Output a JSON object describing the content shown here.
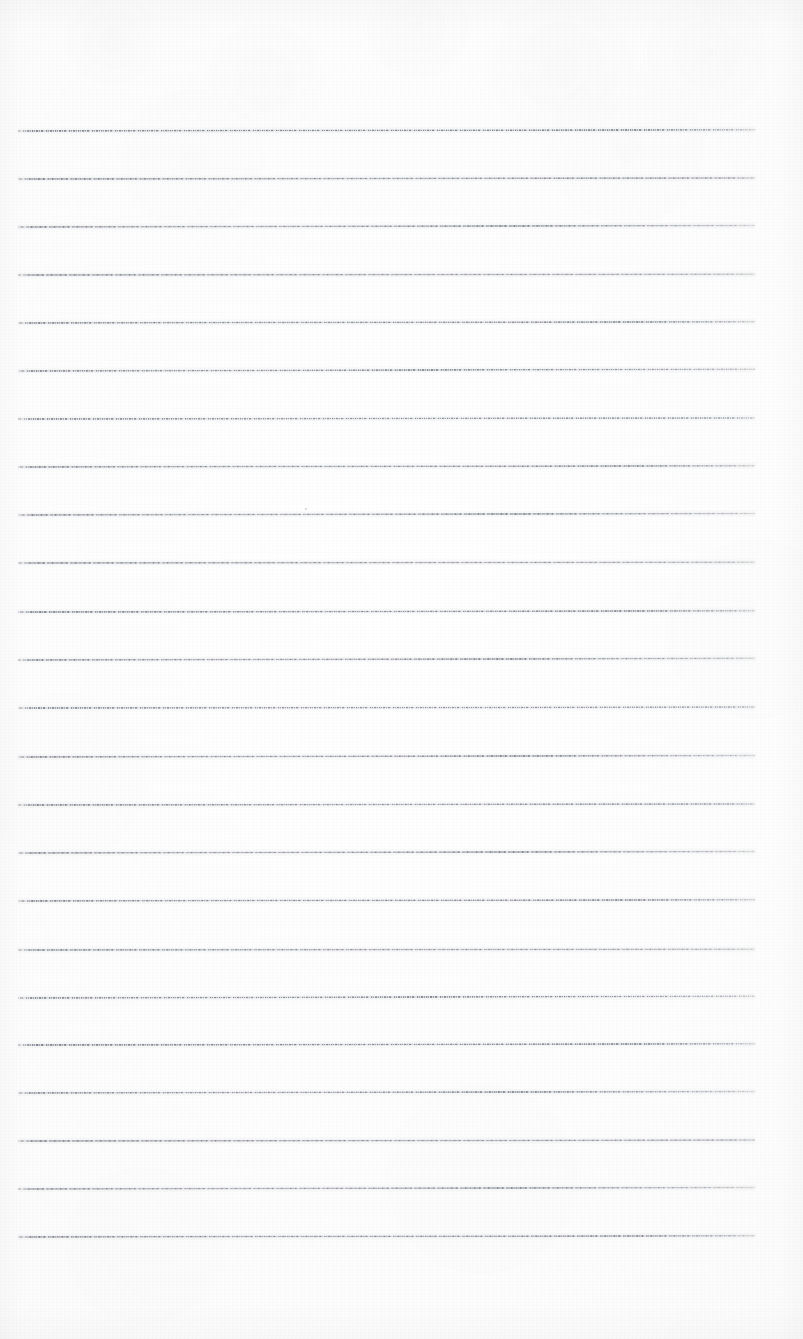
{
  "document": {
    "kind": "scanned-blank-lined-paper",
    "title": "Blank Lined Paper",
    "orientation": "portrait",
    "page_width": 803,
    "page_height": 1339,
    "has_text_content": false,
    "has_handwriting": false,
    "visible_text": "",
    "paper_color": "#fdfdfd",
    "background_color": "#ffffff"
  },
  "ruling": {
    "style": "dashed",
    "description": "Faint gray dashed horizontal ruled lines",
    "color": "#686c7a",
    "line_count": 24,
    "line_thickness": 1,
    "line_spacing": 48.1,
    "left_margin": 18,
    "right_margin": 48,
    "line_start_x": 18,
    "line_end_x": 755,
    "first_line_y": 131,
    "last_line_y": 1237,
    "top_margin": 131,
    "bottom_margin": 102,
    "vertical_margin_rule": false,
    "line_y_positions": [
      131,
      179,
      227,
      275,
      323,
      371,
      419,
      467,
      515,
      563,
      612,
      660,
      708,
      757,
      805,
      853,
      901,
      950,
      998,
      1045,
      1093,
      1141,
      1189,
      1237
    ],
    "line_opacity": [
      0.88,
      0.86,
      0.84,
      0.82,
      0.86,
      0.84,
      0.8,
      0.86,
      0.84,
      0.82,
      0.88,
      0.84,
      0.8,
      0.86,
      0.82,
      0.84,
      0.86,
      0.8,
      0.84,
      0.88,
      0.82,
      0.84,
      0.8,
      0.86
    ],
    "line_tilt_deg": [
      -0.1,
      -0.08,
      -0.12,
      -0.06,
      -0.1,
      -0.14,
      -0.08,
      -0.1,
      -0.12,
      -0.06,
      -0.09,
      -0.13,
      -0.07,
      -0.11,
      -0.08,
      -0.12,
      -0.1,
      -0.06,
      -0.14,
      -0.09,
      -0.11,
      -0.07,
      -0.12,
      -0.1
    ]
  },
  "marks": [
    {
      "name": "page-speck",
      "x": 305,
      "y": 508,
      "size": 2
    }
  ]
}
